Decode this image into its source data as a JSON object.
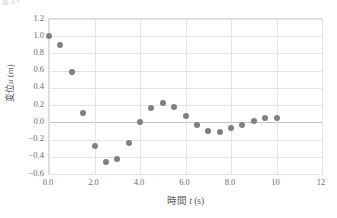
{
  "caption": {
    "fragment": "図. 4.7"
  },
  "chart_data": {
    "type": "scatter",
    "title": "",
    "subtitle": "",
    "xlabel": "時間 t (s)",
    "ylabel": "変位 u (m)",
    "xlabel_parts": {
      "name": "時間",
      "symbol": "t",
      "unit": "(s)"
    },
    "ylabel_parts": {
      "name": "変位",
      "symbol": "u",
      "unit": "(m)"
    },
    "xlim": [
      0,
      12
    ],
    "ylim": [
      -0.6,
      1.2
    ],
    "xticks": [
      0,
      2,
      4,
      6,
      8,
      10,
      12
    ],
    "xticklabels": [
      "0.0",
      "2.0",
      "4.0",
      "6.0",
      "8.0",
      "10",
      "12"
    ],
    "yticks": [
      -0.6,
      -0.4,
      -0.2,
      0.0,
      0.2,
      0.4,
      0.6,
      0.8,
      1.0,
      1.2
    ],
    "yticklabels": [
      "−0.6",
      "−0.4",
      "−0.2",
      "0.0",
      "0.2",
      "0.4",
      "0.6",
      "0.8",
      "1.0",
      "1.2"
    ],
    "grid": true,
    "grid_axis": "both",
    "legend": false,
    "legend_position": "none",
    "marker": "circle",
    "marker_color": "#808080",
    "marker_size": 6,
    "x": [
      0.0,
      0.5,
      1.0,
      1.5,
      2.0,
      2.5,
      3.0,
      3.5,
      4.0,
      4.5,
      5.0,
      5.5,
      6.0,
      6.5,
      7.0,
      7.5,
      8.0,
      8.5,
      9.0,
      9.5,
      10.0
    ],
    "y": [
      1.0,
      0.9,
      0.58,
      0.11,
      -0.28,
      -0.46,
      -0.42,
      -0.24,
      0.0,
      0.17,
      0.22,
      0.18,
      0.07,
      -0.03,
      -0.1,
      -0.11,
      -0.07,
      -0.03,
      0.02,
      0.05,
      0.05
    ],
    "series": [
      {
        "name": "変位 u",
        "points": [
          {
            "x": 0.0,
            "y": 1.0
          },
          {
            "x": 0.5,
            "y": 0.9
          },
          {
            "x": 1.0,
            "y": 0.58
          },
          {
            "x": 1.5,
            "y": 0.11
          },
          {
            "x": 2.0,
            "y": -0.28
          },
          {
            "x": 2.5,
            "y": -0.46
          },
          {
            "x": 3.0,
            "y": -0.42
          },
          {
            "x": 3.5,
            "y": -0.24
          },
          {
            "x": 4.0,
            "y": 0.0
          },
          {
            "x": 4.5,
            "y": 0.17
          },
          {
            "x": 5.0,
            "y": 0.22
          },
          {
            "x": 5.5,
            "y": 0.18
          },
          {
            "x": 6.0,
            "y": 0.07
          },
          {
            "x": 6.5,
            "y": -0.03
          },
          {
            "x": 7.0,
            "y": -0.1
          },
          {
            "x": 7.5,
            "y": -0.11
          },
          {
            "x": 8.0,
            "y": -0.07
          },
          {
            "x": 8.5,
            "y": -0.03
          },
          {
            "x": 9.0,
            "y": 0.02
          },
          {
            "x": 9.5,
            "y": 0.05
          },
          {
            "x": 10.0,
            "y": 0.05
          }
        ]
      }
    ],
    "colors": {
      "marker": "#808080",
      "grid": "#e4e4e4",
      "frame": "#d9d9d9",
      "zero_line": "#c4c4c4",
      "text": "#595959"
    }
  }
}
